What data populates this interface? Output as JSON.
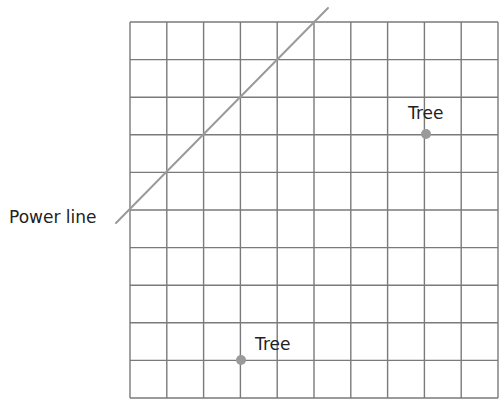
{
  "diagram": {
    "type": "grid-map",
    "grid": {
      "columns": 10,
      "rows": 10,
      "left": 130,
      "top": 22,
      "width": 368,
      "height": 376,
      "line_color": "#7a7a7a"
    },
    "power_line": {
      "label": "Power line",
      "color": "#9a9a9a",
      "from": [
        116,
        223
      ],
      "to": [
        328,
        8
      ],
      "grid_path": "diagonal from left edge row 5 to top edge column 5"
    },
    "trees": [
      {
        "label": "Tree",
        "x": 426,
        "y": 134,
        "grid_col": 8,
        "grid_row": 3,
        "color": "#9a9a9a"
      },
      {
        "label": "Tree",
        "x": 241,
        "y": 360,
        "grid_col": 3,
        "grid_row": 9,
        "color": "#9a9a9a"
      }
    ]
  }
}
